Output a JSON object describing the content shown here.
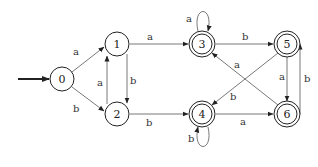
{
  "diagram": {
    "type": "DFA state diagram",
    "start_state": "0",
    "states": [
      {
        "id": "0",
        "label": "0",
        "accepting": false
      },
      {
        "id": "1",
        "label": "1",
        "accepting": false
      },
      {
        "id": "2",
        "label": "2",
        "accepting": false
      },
      {
        "id": "3",
        "label": "3",
        "accepting": true
      },
      {
        "id": "4",
        "label": "4",
        "accepting": true
      },
      {
        "id": "5",
        "label": "5",
        "accepting": true
      },
      {
        "id": "6",
        "label": "6",
        "accepting": true
      }
    ],
    "transitions": [
      {
        "from": "0",
        "to": "1",
        "label": "a"
      },
      {
        "from": "0",
        "to": "2",
        "label": "b"
      },
      {
        "from": "1",
        "to": "3",
        "label": "a"
      },
      {
        "from": "1",
        "to": "2",
        "label": "b"
      },
      {
        "from": "2",
        "to": "1",
        "label": "a"
      },
      {
        "from": "2",
        "to": "4",
        "label": "b"
      },
      {
        "from": "3",
        "to": "3",
        "label": "a"
      },
      {
        "from": "3",
        "to": "5",
        "label": "b"
      },
      {
        "from": "4",
        "to": "4",
        "label": "b"
      },
      {
        "from": "4",
        "to": "6",
        "label": "a"
      },
      {
        "from": "5",
        "to": "6",
        "label": "a"
      },
      {
        "from": "5",
        "to": "4",
        "label": "b"
      },
      {
        "from": "6",
        "to": "3",
        "label": "a"
      },
      {
        "from": "6",
        "to": "5",
        "label": "b"
      }
    ]
  }
}
